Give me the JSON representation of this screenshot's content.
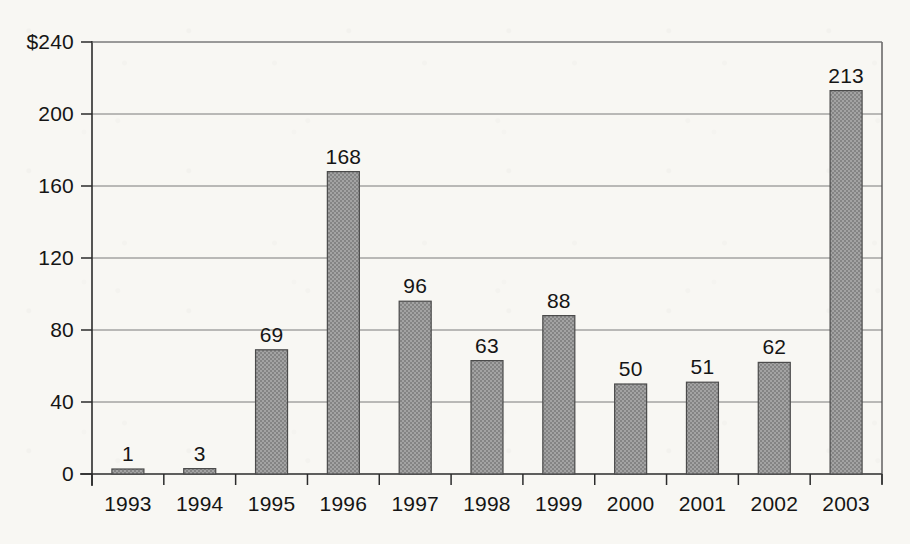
{
  "chart_data": {
    "type": "bar",
    "title": "",
    "xlabel": "",
    "ylabel": "",
    "categories": [
      "1993",
      "1994",
      "1995",
      "1996",
      "1997",
      "1998",
      "1999",
      "2000",
      "2001",
      "2002",
      "2003"
    ],
    "values": [
      1,
      3,
      69,
      168,
      96,
      63,
      88,
      50,
      51,
      62,
      213
    ],
    "value_labels": [
      "1",
      "3",
      "69",
      "168",
      "96",
      "63",
      "88",
      "50",
      "51",
      "62",
      "213"
    ],
    "ylim": [
      0,
      240
    ],
    "yticks": [
      0,
      40,
      80,
      120,
      160,
      200,
      240
    ],
    "ytick_labels": [
      "0",
      "40",
      "80",
      "120",
      "160",
      "200",
      "$240"
    ],
    "grid": true,
    "legend": null,
    "currency_prefix": "$",
    "series_name": "",
    "bar_fill_color": "#9a9a9a",
    "bar_edge_color": "#4b4b4b",
    "grid_color": "#7a7a7a",
    "axis_color": "#2b2b2b",
    "background_color": "#f8f7f3"
  }
}
